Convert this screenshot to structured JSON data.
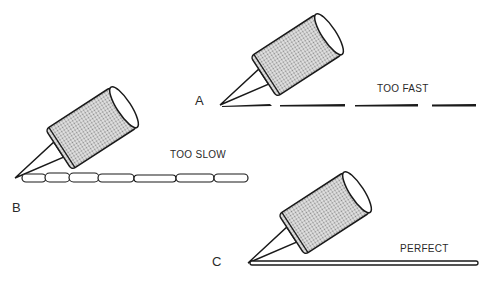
{
  "diagram": {
    "title": "",
    "panels": [
      {
        "id": "A",
        "letter": "A",
        "caption": "TOO FAST",
        "bead": "broken dashes"
      },
      {
        "id": "B",
        "letter": "B",
        "caption": "TOO SLOW",
        "bead": "lumpy segments"
      },
      {
        "id": "C",
        "letter": "C",
        "caption": "PERFECT",
        "bead": "continuous smooth line"
      }
    ],
    "colors": {
      "ink": "#1a1a1a",
      "tube_fill": "#c9c9c9",
      "background": "#ffffff"
    }
  }
}
